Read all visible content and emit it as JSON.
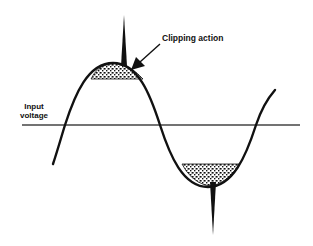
{
  "diagram": {
    "labels": {
      "clipping": "Clipping action",
      "axis_line1": "Input",
      "axis_line2": "voltage"
    },
    "colors": {
      "stroke": "#111111",
      "background": "#ffffff",
      "stipple": "#222222"
    },
    "waveform": {
      "type": "sine",
      "zero_crossings_x": [
        65,
        160,
        256
      ],
      "axis_y": 125,
      "peak": {
        "x": 113,
        "y": 63
      },
      "trough": {
        "x": 208,
        "y": 187
      },
      "clip_level_top_y": 79,
      "clip_level_bottom_y": 164,
      "spike_top": {
        "x": 124,
        "tip_y": 15
      },
      "spike_bottom": {
        "x": 213,
        "tip_y": 235
      }
    }
  }
}
